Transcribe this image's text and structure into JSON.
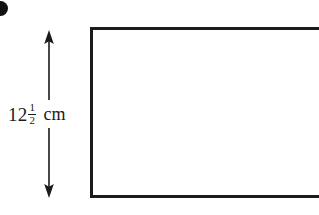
{
  "figure": {
    "background_color": "#ffffff",
    "stroke_color": "#1b1b1b",
    "width": 319,
    "height": 215,
    "corner_mark": {
      "name": "bullet-mark",
      "shape": "circle",
      "color": "#121212",
      "clipped": "true"
    },
    "shape": {
      "type": "rectangle",
      "stroke_color": "#1b1b1b",
      "stroke_width": 3,
      "cropped_side": "right"
    },
    "dimension": {
      "orientation": "vertical",
      "arrow_style": "double-headed",
      "label_whole": "12",
      "label_numerator": "1",
      "label_denominator": "2",
      "label_unit": "cm",
      "label_full": "12 1/2 cm"
    }
  }
}
